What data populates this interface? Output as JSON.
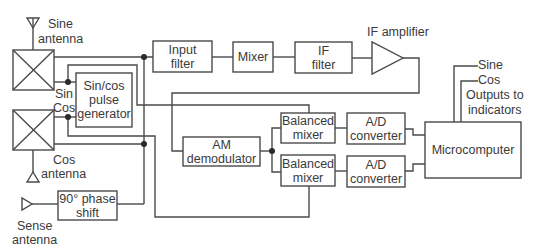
{
  "diagram": {
    "title": "",
    "blocks": {
      "input_filter": "Input\nfilter",
      "mixer": "Mixer",
      "if_filter": "IF\nfilter",
      "if_amplifier": "IF amplifier",
      "pulse_generator": "Sin/cos\npulse\ngenerator",
      "am_demodulator": "AM\ndemodulator",
      "balanced_mixer_top": "Balanced\nmixer",
      "balanced_mixer_bottom": "Balanced\nmixer",
      "ad_converter_top": "A/D\nconverter",
      "ad_converter_bottom": "A/D\nconverter",
      "microcomputer": "Microcomputer",
      "phase_shift": "90° phase\nshift"
    },
    "labels": {
      "sine_antenna_1": "Sine",
      "sine_antenna_2": "antenna",
      "cos_antenna_1": "Cos",
      "cos_antenna_2": "antenna",
      "sense_antenna_1": "Sense",
      "sense_antenna_2": "antenna",
      "sin": "Sin",
      "cos": "Cos",
      "output_sine": "Sine",
      "output_cos": "Cos",
      "outputs_1": "Outputs to",
      "outputs_2": "indicators"
    },
    "colors": {
      "line": "#4a4a4a",
      "text": "#3a3a3a",
      "background": "#ffffff"
    }
  }
}
